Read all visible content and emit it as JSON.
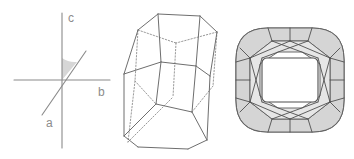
{
  "figure": {
    "background_color": "#ffffff",
    "width": 354,
    "height": 159
  },
  "panels": [
    {
      "id": "axis-diagram",
      "name": "crystallographic-axes",
      "description": "Three crystallographic axes a, b, c with an oblique angle marked between the a axis and the c axis",
      "labels": [
        {
          "text": "c",
          "axis": "c-axis",
          "x": 68,
          "y": 22
        },
        {
          "text": "b",
          "axis": "b-axis",
          "x": 98,
          "y": 96
        },
        {
          "text": "a",
          "axis": "a-axis",
          "x": 46,
          "y": 127
        }
      ],
      "axes": [
        {
          "name": "c-axis",
          "x1": 62,
          "y1": 13,
          "x2": 62,
          "y2": 148
        },
        {
          "name": "b-axis",
          "x1": 14,
          "y1": 80,
          "x2": 110,
          "y2": 80
        },
        {
          "name": "a-axis",
          "x1": 42,
          "y1": 115,
          "x2": 86,
          "y2": 51
        }
      ],
      "angle_marker": {
        "name": "beta-angle-wedge",
        "fill": "#d6d6d6",
        "center_x": 62,
        "center_y": 80,
        "radius": 22
      },
      "line_color": "#8a8a8a",
      "label_color": "#8c8c8c"
    },
    {
      "id": "crystal-habit",
      "name": "crystal-habit-drawing",
      "description": "Beveled prismatic crystal habit drawn in perspective with dotted hidden edges",
      "solid_edge_color": "#6e6e6e",
      "hidden_edge_color": "#9a9a9a",
      "face_fill": "#ffffff"
    },
    {
      "id": "gemstone",
      "name": "cushion-cut-gemstone",
      "description": "Cushion-cut gemstone viewed face-up showing table, crown facets and girdle",
      "outline_color": "#5f5f5f",
      "facet_line_color": "#4f4f4f",
      "shaded_facet_color": "#d5d5d5",
      "light_facet_color": "#e6e6e6",
      "table_color": "#ffffff"
    }
  ]
}
